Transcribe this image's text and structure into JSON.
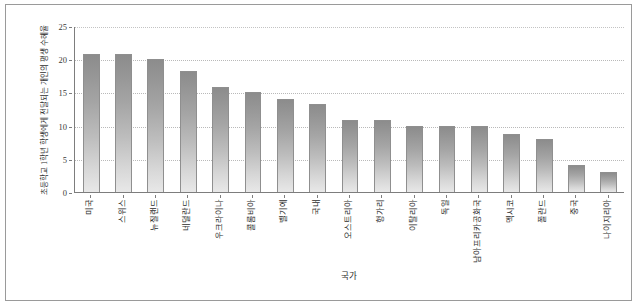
{
  "chart_data": {
    "type": "bar",
    "title": "",
    "subtitle": "",
    "xlabel": "국가",
    "ylabel": "초등학교 1학년 학생에게 전달되는 개인의 평생 수혜율",
    "ylim": [
      0,
      25
    ],
    "yticks": [
      0,
      5,
      10,
      15,
      20,
      25
    ],
    "ytick_labels": [
      "0",
      "5",
      "10",
      "15",
      "20",
      "25"
    ],
    "grid": true,
    "grid_axis": "y",
    "legend": false,
    "legend_position": "none",
    "bar_color": "#a8a8a8",
    "bar_edge_color": "#8f8f8f",
    "categories": [
      "미국",
      "스위스",
      "뉴질랜드",
      "네덜란드",
      "우크라이나",
      "콜롬비아",
      "벨기에",
      "국내",
      "오스트리아",
      "헝가리",
      "이탈리아",
      "독일",
      "남아프리카공화국",
      "멕시코",
      "폴란드",
      "중국",
      "나이지리아"
    ],
    "values": [
      20.8,
      20.8,
      20.0,
      18.2,
      15.8,
      15.0,
      14.0,
      13.2,
      10.8,
      10.8,
      10.0,
      10.0,
      10.0,
      8.8,
      8.0,
      4.0,
      3.0
    ]
  }
}
